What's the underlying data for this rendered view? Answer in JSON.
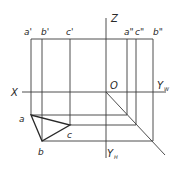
{
  "diagram": {
    "type": "orthographic-projection-three-view",
    "axes": {
      "z_label": "Z",
      "x_label": "X",
      "origin_label": "O",
      "yw_label": "Y",
      "yw_sub": "W",
      "yh_label": "Y",
      "yh_sub": "H"
    },
    "front_view_points": {
      "a": "a'",
      "b": "b'",
      "c": "c'"
    },
    "side_view_points": {
      "a": "a\"",
      "c": "c\"",
      "b": "b\""
    },
    "top_view_points": {
      "a": "a",
      "b": "b",
      "c": "c"
    }
  }
}
